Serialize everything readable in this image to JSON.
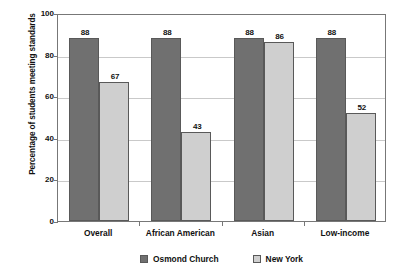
{
  "chart_data": {
    "type": "bar",
    "title": "",
    "xlabel": "",
    "ylabel": "Percentage of students meeting standards",
    "categories": [
      "Overall",
      "African American",
      "Asian",
      "Low-income"
    ],
    "series": [
      {
        "name": "Osmond Church",
        "color": "#707070",
        "values": [
          88,
          88,
          88,
          88
        ]
      },
      {
        "name": "New York",
        "color": "#cfcfcf",
        "values": [
          67,
          43,
          86,
          52
        ]
      }
    ],
    "ylim": [
      0,
      100
    ],
    "yticks": [
      0,
      20,
      40,
      60,
      80,
      100
    ],
    "ytick_labels": [
      "0",
      "20",
      "40",
      "60",
      "80",
      "100"
    ],
    "grid": true,
    "legend_position": "bottom",
    "data_labels": true
  },
  "axis": {
    "y_title": "Percentage of students meeting standards"
  },
  "legend": {
    "items": [
      {
        "label": "Osmond Church"
      },
      {
        "label": "New York"
      }
    ]
  }
}
